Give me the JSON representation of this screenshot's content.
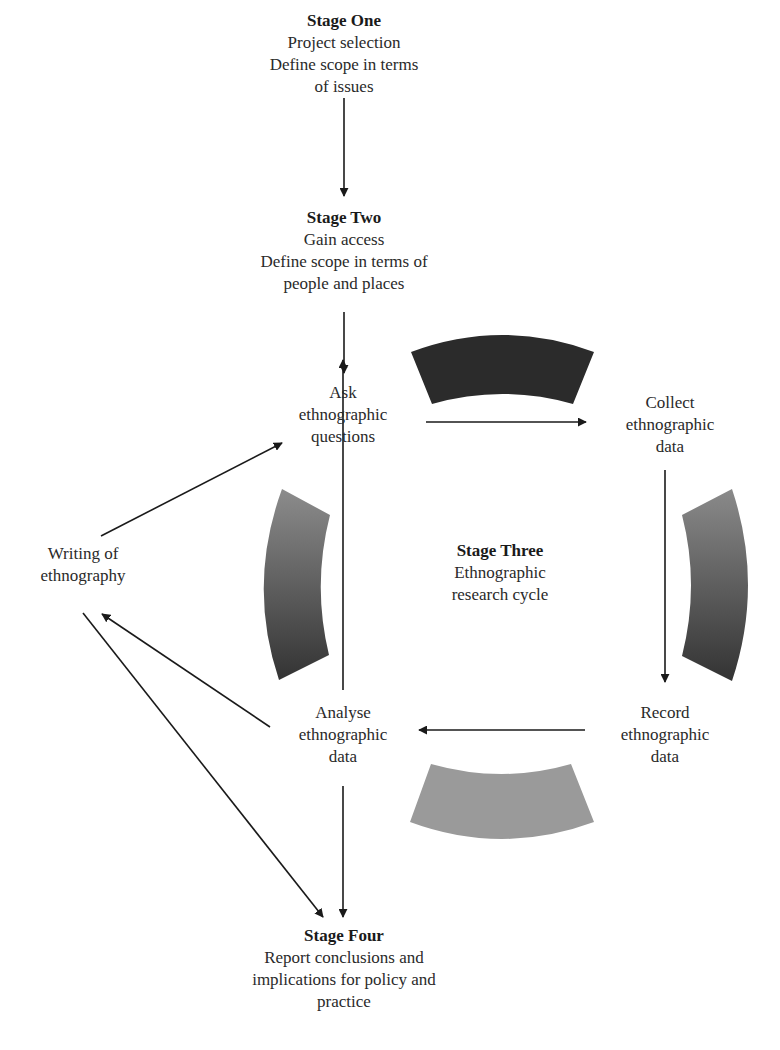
{
  "diagram": {
    "type": "flow-cycle",
    "stages": {
      "stage_one": {
        "title": "Stage One",
        "lines": [
          "Project selection",
          "Define scope in terms",
          "of issues"
        ]
      },
      "stage_two": {
        "title": "Stage Two",
        "lines": [
          "Gain access",
          "Define scope in terms of",
          "people and places"
        ]
      },
      "stage_three": {
        "title": "Stage Three",
        "lines": [
          "Ethnographic",
          "research cycle"
        ]
      },
      "stage_four": {
        "title": "Stage Four",
        "lines": [
          "Report conclusions and",
          "implications for policy and",
          "practice"
        ]
      }
    },
    "cycle_nodes": {
      "ask": {
        "lines": [
          "Ask",
          "ethnographic",
          "questions"
        ]
      },
      "collect": {
        "lines": [
          "Collect",
          "ethnographic",
          "data"
        ]
      },
      "record": {
        "lines": [
          "Record",
          "ethnographic",
          "data"
        ]
      },
      "analyse": {
        "lines": [
          "Analyse",
          "ethnographic",
          "data"
        ]
      }
    },
    "side_nodes": {
      "writing": {
        "lines": [
          "Writing of",
          "ethnography"
        ]
      }
    },
    "edges": [
      {
        "from": "Stage One",
        "to": "Stage Two"
      },
      {
        "from": "Stage Two",
        "to": "Ask ethnographic questions"
      },
      {
        "from": "Ask ethnographic questions",
        "to": "Collect ethnographic data"
      },
      {
        "from": "Collect ethnographic data",
        "to": "Record ethnographic data"
      },
      {
        "from": "Record ethnographic data",
        "to": "Analyse ethnographic data"
      },
      {
        "from": "Analyse ethnographic data",
        "to": "Ask ethnographic questions"
      },
      {
        "from": "Analyse ethnographic data",
        "to": "Writing of ethnography"
      },
      {
        "from": "Writing of ethnography",
        "to": "Ask ethnographic questions"
      },
      {
        "from": "Writing of ethnography",
        "to": "Stage Four"
      },
      {
        "from": "Analyse ethnographic data",
        "to": "Stage Four"
      }
    ],
    "arc_colors": {
      "top": "#2b2b2b",
      "right_start": "#8a8a8a",
      "right_end": "#333333",
      "bottom": "#9a9a9a",
      "left_start": "#8c8c8c",
      "left_end": "#333333"
    }
  }
}
